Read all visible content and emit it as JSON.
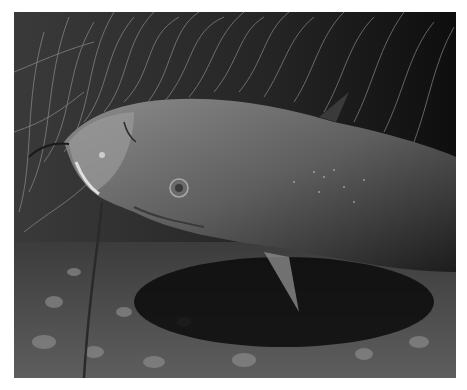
{
  "image": {
    "subject": "catfish",
    "description": "Grayscale underwater photograph of a catfish resting above a gravel bottom, with long barbels and fine grass-like weeds in the background",
    "colors": {
      "background": "#ffffff",
      "water_dark": "#141414",
      "fish_body": "#6e6e6e",
      "fish_head": "#8a8a8a",
      "weeds": "#9a9a9a",
      "gravel": "#5a5a5a"
    }
  }
}
